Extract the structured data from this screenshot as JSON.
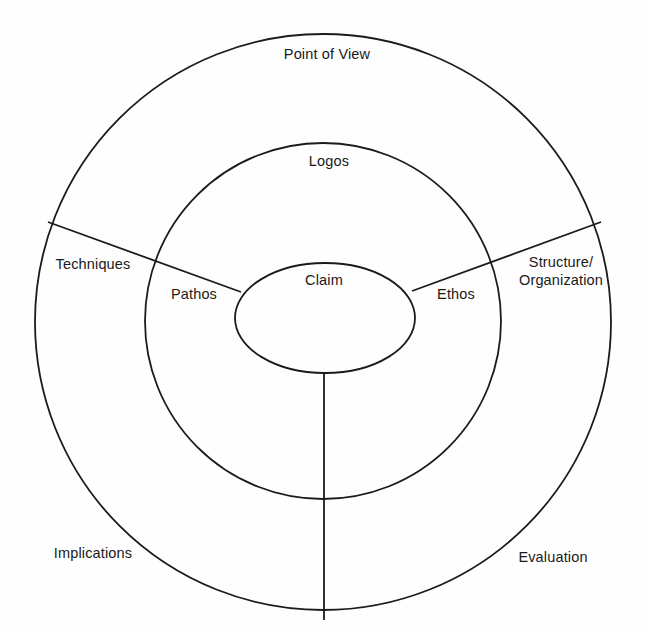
{
  "diagram": {
    "type": "concentric-rings",
    "background_color": "#fefefe",
    "stroke_color": "#1b1b1b",
    "text_color": "#1a1a1a",
    "geometry": {
      "outer_circle": {
        "cx": 323,
        "cy": 322,
        "r": 288
      },
      "middle_circle": {
        "cx": 323,
        "cy": 321,
        "r": 178
      },
      "inner_ellipse": {
        "cx": 325,
        "cy": 318,
        "rx": 90,
        "ry": 55
      }
    },
    "rings": [
      {
        "name": "core",
        "labels": [
          {
            "id": "claim",
            "text": "Claim",
            "x": 324,
            "y": 281
          }
        ]
      },
      {
        "name": "middle-ring",
        "labels": [
          {
            "id": "logos",
            "text": "Logos",
            "x": 329,
            "y": 162
          },
          {
            "id": "pathos",
            "text": "Pathos",
            "x": 194,
            "y": 295
          },
          {
            "id": "ethos",
            "text": "Ethos",
            "x": 456,
            "y": 295
          }
        ]
      },
      {
        "name": "outer-ring",
        "labels": [
          {
            "id": "point-of-view",
            "text": "Point of View",
            "x": 327,
            "y": 55
          },
          {
            "id": "techniques",
            "text": "Techniques",
            "x": 93,
            "y": 265
          },
          {
            "id": "structure-organization",
            "line1": "Structure/",
            "line2": "Organization",
            "x": 561,
            "y": 272
          },
          {
            "id": "implications",
            "text": "Implications",
            "x": 93,
            "y": 554
          },
          {
            "id": "evaluation",
            "text": "Evaluation",
            "x": 553,
            "y": 558
          }
        ]
      }
    ],
    "dividers": [
      {
        "id": "divider-upper-left",
        "x1": 241,
        "y1": 292,
        "x2": 48,
        "y2": 222
      },
      {
        "id": "divider-upper-right",
        "x1": 412,
        "y1": 291,
        "x2": 601,
        "y2": 222
      },
      {
        "id": "divider-bottom",
        "x1": 324,
        "y1": 372,
        "x2": 324,
        "y2": 620
      }
    ]
  }
}
